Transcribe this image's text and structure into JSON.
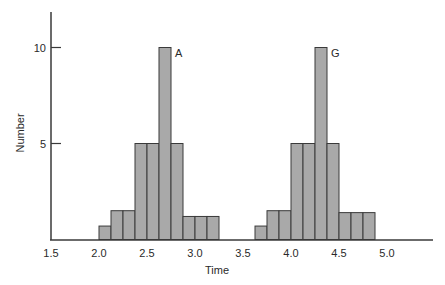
{
  "chart_data": {
    "type": "bar",
    "subtype": "histogram",
    "title": "",
    "xlabel": "Time",
    "ylabel": "Number",
    "xlim": [
      1.5,
      5.45
    ],
    "ylim": [
      0,
      12
    ],
    "grid": false,
    "legend": null,
    "x_ticks": [
      "1.5",
      "2.0",
      "2.5",
      "3.0",
      "3.5",
      "4.0",
      "4.5",
      "5.0"
    ],
    "x_tick_values": [
      1.5,
      2.0,
      2.5,
      3.0,
      3.5,
      4.0,
      4.5,
      5.0
    ],
    "y_ticks": [
      "5",
      "10"
    ],
    "y_tick_values": [
      5,
      10
    ],
    "bin_width": 0.125,
    "series": [
      {
        "name": "A",
        "bin_starts": [
          2.0,
          2.125,
          2.25,
          2.375,
          2.5,
          2.625,
          2.75,
          2.875,
          3.0,
          3.125
        ],
        "values": [
          0.7,
          1.5,
          1.5,
          5,
          5,
          10,
          5,
          1.2,
          1.2,
          1.2
        ]
      },
      {
        "name": "G",
        "bin_starts": [
          3.625,
          3.75,
          3.875,
          4.0,
          4.125,
          4.25,
          4.375,
          4.5,
          4.625,
          4.75
        ],
        "values": [
          0.7,
          1.5,
          1.5,
          5,
          5,
          10,
          5,
          1.4,
          1.4,
          1.4
        ]
      }
    ],
    "annotations": [
      {
        "text": "A",
        "x": 2.75,
        "y": 10
      },
      {
        "text": "G",
        "x": 4.375,
        "y": 10
      }
    ],
    "colors": {
      "bar_fill": "#a9a9a9",
      "bar_stroke": "#3a3a3a",
      "axis": "#3a3a3a"
    }
  }
}
